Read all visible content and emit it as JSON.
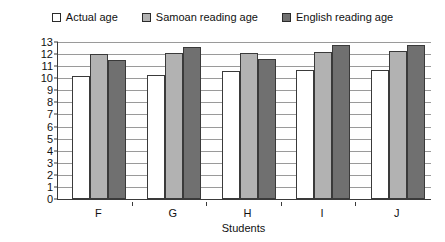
{
  "chart_data": {
    "type": "bar",
    "title": "",
    "xlabel": "Students",
    "ylabel": "Age (years)",
    "categories": [
      "F",
      "G",
      "H",
      "I",
      "J"
    ],
    "ylim": [
      0,
      13
    ],
    "y_ticks": [
      0,
      1,
      2,
      3,
      4,
      5,
      6,
      7,
      8,
      9,
      10,
      11,
      12,
      13
    ],
    "y_tick_labels": [
      "0",
      "1",
      "2",
      "3",
      "4",
      "5",
      "6",
      "7",
      "8",
      "9",
      "10",
      "11",
      "12",
      "13"
    ],
    "grid": true,
    "legend_position": "top-center",
    "series": [
      {
        "name": "Actual age",
        "color": "#ffffff",
        "edge_color": "#3a3a3a",
        "values": [
          10.2,
          10.3,
          10.6,
          10.7,
          10.7
        ]
      },
      {
        "name": "Samoan reading age",
        "color": "#b2b2b2",
        "edge_color": "#3a3a3a",
        "values": [
          12.0,
          12.05,
          12.1,
          12.2,
          12.25
        ]
      },
      {
        "name": "English reading age",
        "color": "#707070",
        "edge_color": "#3a3a3a",
        "values": [
          11.5,
          12.6,
          11.6,
          12.75,
          12.75
        ]
      }
    ]
  },
  "legend": {
    "items": [
      {
        "label": "Actual age",
        "swatch": "#ffffff"
      },
      {
        "label": "Samoan reading age",
        "swatch": "#b2b2b2"
      },
      {
        "label": "English reading age",
        "swatch": "#707070"
      }
    ]
  },
  "axes": {
    "y_title": "Age (years)",
    "x_title": "Students"
  }
}
